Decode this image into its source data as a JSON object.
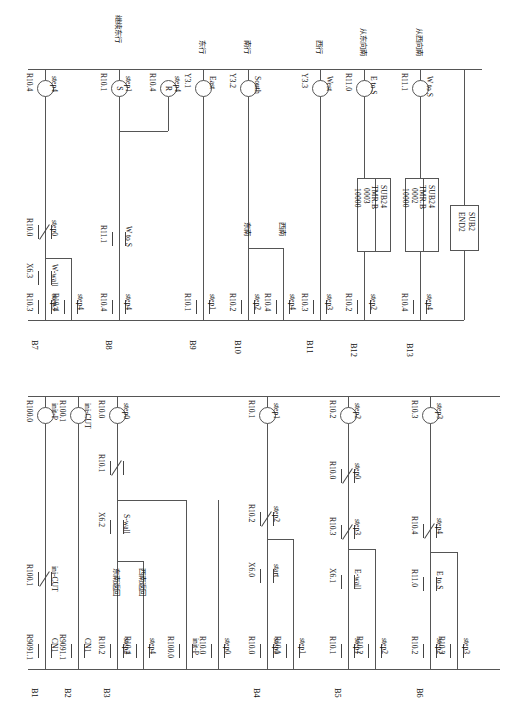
{
  "diagram": {
    "type": "ladder-logic",
    "orientation": "rotated-90-ccw",
    "line_color": "#555555"
  },
  "blocks": {
    "timer1": {
      "instruction": "SUB24",
      "mnemonic": "TMR.B",
      "number": "0003",
      "preset": "10000"
    },
    "timer2": {
      "instruction": "SUB24",
      "mnemonic": "TMR.B",
      "number": "0002",
      "preset": "10000"
    },
    "end": {
      "instruction": "SUB2",
      "mnemonic": "END2"
    }
  },
  "rungs": [
    {
      "id": "B1",
      "label": "B1",
      "contacts": [
        {
          "address": "R9091.1",
          "comment": "CN1",
          "type": "NO"
        }
      ],
      "series": [
        {
          "address": "R100.1",
          "comment": "ini-CUT",
          "type": "NC"
        }
      ],
      "coil": {
        "address": "R100.0",
        "comment": "init-P",
        "type": "OUT"
      }
    },
    {
      "id": "B2",
      "label": "B2",
      "contacts": [
        {
          "address": "R9091.1",
          "comment": "CN1",
          "type": "NO"
        }
      ],
      "coil": {
        "address": "R100.1",
        "comment": "ini-CUT",
        "type": "OUT"
      }
    },
    {
      "id": "B3",
      "label": "B3",
      "contacts": [
        {
          "address": "R10.2",
          "comment": "step2",
          "type": "NO",
          "note": "东南返回"
        },
        {
          "address": "R10.4",
          "comment": "step4",
          "type": "NO",
          "note": "西南返回"
        },
        {
          "address": "R100.0",
          "comment": "init-P",
          "type": "NO"
        },
        {
          "address": "R10.0",
          "comment": "step0",
          "type": "NO"
        }
      ],
      "series": [
        {
          "address": "X6.2",
          "comment": "S-wall",
          "type": "NO"
        },
        {
          "address": "R10.1",
          "comment": "",
          "type": "NC"
        }
      ],
      "coil": {
        "address": "R10.0",
        "comment": "step0",
        "type": "OUT"
      }
    },
    {
      "id": "B4",
      "label": "B4",
      "contacts": [
        {
          "address": "R10.0",
          "comment": "step0",
          "type": "NO"
        },
        {
          "address": "R10.1",
          "comment": "step1",
          "type": "NO"
        }
      ],
      "series": [
        {
          "address": "X6.0",
          "comment": "start",
          "type": "NO"
        },
        {
          "address": "R10.2",
          "comment": "step2",
          "type": "NC"
        }
      ],
      "coil": {
        "address": "R10.1",
        "comment": "step1",
        "type": "OUT"
      }
    },
    {
      "id": "B5",
      "label": "B5",
      "contacts": [
        {
          "address": "R10.1",
          "comment": "step1",
          "type": "NO"
        },
        {
          "address": "R10.2",
          "comment": "step2",
          "type": "NO"
        }
      ],
      "series": [
        {
          "address": "X6.1",
          "comment": "E-wall",
          "type": "NO"
        },
        {
          "address": "R10.3",
          "comment": "step3",
          "type": "NC"
        },
        {
          "address": "R10.0",
          "comment": "step0",
          "type": "NC"
        }
      ],
      "coil": {
        "address": "R10.2",
        "comment": "step2",
        "type": "OUT"
      }
    },
    {
      "id": "B6",
      "label": "B6",
      "contacts": [
        {
          "address": "R10.2",
          "comment": "step2",
          "type": "NO"
        },
        {
          "address": "R10.3",
          "comment": "step3",
          "type": "NO"
        }
      ],
      "series": [
        {
          "address": "R11.0",
          "comment": "E to S",
          "type": "NO"
        },
        {
          "address": "R10.4",
          "comment": "step4",
          "type": "NC"
        }
      ],
      "coil": {
        "address": "R10.3",
        "comment": "step3",
        "type": "OUT"
      }
    },
    {
      "id": "B7",
      "label": "B7",
      "contacts": [
        {
          "address": "R10.3",
          "comment": "step3",
          "type": "NO"
        },
        {
          "address": "R10.4",
          "comment": "",
          "type": "NO"
        }
      ],
      "series": [
        {
          "address": "X6.3",
          "comment": "W-wall",
          "type": "NO"
        },
        {
          "address": "R10.0",
          "comment": "step0",
          "type": "NC"
        }
      ],
      "coil": {
        "address": "R10.4",
        "comment": "step4",
        "type": "OUT"
      }
    },
    {
      "id": "B8",
      "label": "B8",
      "contacts": [
        {
          "address": "R10.4",
          "comment": "step4",
          "type": "NO"
        }
      ],
      "series": [
        {
          "address": "R11.1",
          "comment": "W to S",
          "type": "NO"
        }
      ],
      "coils": [
        {
          "address": "R10.1",
          "comment": "step1",
          "type": "SET",
          "letter": "S",
          "note": "继续东行"
        },
        {
          "address": "R10.4",
          "comment": "step4",
          "type": "RESET",
          "letter": "R"
        }
      ]
    },
    {
      "id": "B9",
      "label": "B9",
      "contacts": [
        {
          "address": "R10.1",
          "comment": "step1",
          "type": "NO"
        }
      ],
      "coil": {
        "address": "Y3.1",
        "comment": "East",
        "type": "OUT",
        "note": "东行"
      }
    },
    {
      "id": "B10",
      "label": "B10",
      "contacts": [
        {
          "address": "R10.2",
          "comment": "step2",
          "type": "NO",
          "note": "东南"
        },
        {
          "address": "R10.4",
          "comment": "step4",
          "type": "NO",
          "note": "西南"
        }
      ],
      "coil": {
        "address": "Y3.2",
        "comment": "South",
        "type": "OUT",
        "note": "南行"
      }
    },
    {
      "id": "B11",
      "label": "B11",
      "contacts": [
        {
          "address": "R10.3",
          "comment": "step3",
          "type": "NO"
        }
      ],
      "coil": {
        "address": "Y3.3",
        "comment": "West",
        "type": "OUT",
        "note": "西行"
      }
    },
    {
      "id": "B12",
      "label": "B12",
      "contacts": [
        {
          "address": "R10.2",
          "comment": "step2",
          "type": "NO"
        }
      ],
      "block": "timer1",
      "coil": {
        "address": "R11.0",
        "comment": "E to S",
        "type": "OUT",
        "note": "从东向南"
      }
    },
    {
      "id": "B13",
      "label": "B13",
      "contacts": [
        {
          "address": "R10.4",
          "comment": "step4",
          "type": "NO"
        }
      ],
      "block": "timer2",
      "coil": {
        "address": "R11.1",
        "comment": "W to S",
        "type": "OUT",
        "note": "从西向南"
      }
    }
  ]
}
